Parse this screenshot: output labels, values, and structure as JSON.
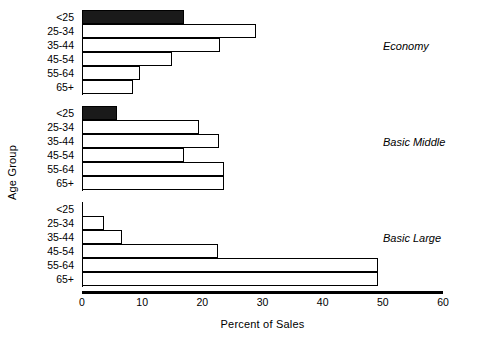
{
  "chart_data": {
    "type": "bar",
    "orientation": "horizontal",
    "title": "",
    "xlabel": "Percent of Sales",
    "ylabel": "Age Group",
    "xlim": [
      0,
      60
    ],
    "xticks": [
      0,
      10,
      20,
      30,
      40,
      50,
      60
    ],
    "xtick_labels": [
      "0",
      "10",
      "20",
      "30",
      "40",
      "50",
      "60"
    ],
    "grid": false,
    "legend": "none",
    "categories": [
      "<25",
      "25-34",
      "35-44",
      "45-54",
      "55-64",
      "65+"
    ],
    "panels": [
      {
        "name": "Economy",
        "values": [
          17,
          29,
          23,
          15,
          9.6,
          8.5
        ],
        "highlight_category": "<25",
        "bar_style": [
          "filled",
          "open",
          "open",
          "open",
          "open",
          "open"
        ]
      },
      {
        "name": "Basic Middle",
        "values": [
          5.8,
          19.4,
          22.8,
          17,
          23.6,
          23.6
        ],
        "highlight_category": "<25",
        "bar_style": [
          "filled",
          "open",
          "open",
          "open",
          "open",
          "open"
        ]
      },
      {
        "name": "Basic Large",
        "values": [
          0,
          3.7,
          6.6,
          22.6,
          49.2,
          49.2
        ],
        "highlight_category": "",
        "bar_style": [
          "open",
          "open",
          "open",
          "open",
          "open",
          "open"
        ]
      }
    ],
    "colors": {
      "bar_fill_open": "#ffffff",
      "bar_fill_highlight": "#1a1a1a",
      "bar_outline": "#000000",
      "axis": "#000000",
      "background": "#ffffff"
    }
  }
}
